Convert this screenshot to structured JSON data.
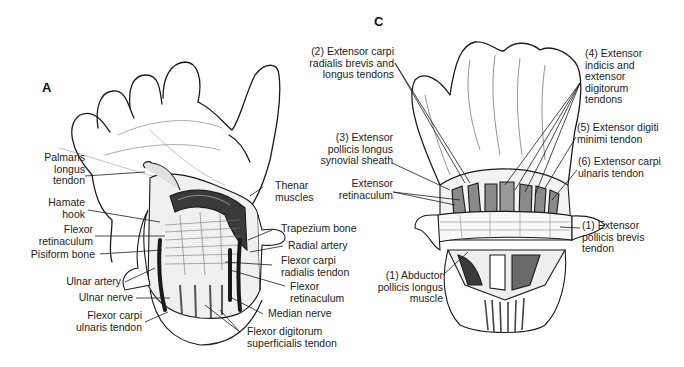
{
  "panels": {
    "a": {
      "letter": "A",
      "labels": {
        "palmaris_longus": "Palmaris\nlongus\ntendon",
        "hamate_hook": "Hamate\nhook",
        "flexor_retinaculum_left": "Flexor\nretinaculum",
        "pisiform_bone": "Pisiform bone",
        "ulnar_artery": "Ulnar artery",
        "ulnar_nerve": "Ulnar nerve",
        "flexor_carpi_ulnaris": "Flexor carpi\nulnaris tendon",
        "thenar_muscles": "Thenar\nmuscles",
        "trapezium_bone": "Trapezium bone",
        "radial_artery": "Radial artery",
        "flexor_carpi_radialis": "Flexor carpi\nradialis tendon",
        "flexor_retinaculum_right": "Flexor\nretinaculum",
        "median_nerve": "Median nerve",
        "flexor_digitorum_superficialis": "Flexor digitorum\nsuperficialis tendon"
      }
    },
    "c": {
      "letter": "C",
      "labels": {
        "ecrb_ecrl": "(2) Extensor carpi\nradialis brevis and\nlongus tendons",
        "epl_sheath": "(3) Extensor\npollicis longus\nsynovial sheath",
        "extensor_retinaculum": "Extensor\nretinaculum",
        "abductor_pollicis_longus": "(1) Abductor\npollicis longus\nmuscle",
        "extensor_indicis": "(4) Extensor\nindicis and\nextensor\ndigitorum\ntendons",
        "extensor_digiti_minimi": "(5) Extensor digiti\nminimi tendon",
        "extensor_carpi_ulnaris": "(6) Extensor carpi\nulnaris tendon",
        "extensor_pollicis_brevis": "(1) Extensor\npollicis brevis\ntendon"
      }
    }
  },
  "colors": {
    "line": "#1a1a1a",
    "muscle_dark": "#3a3a3a",
    "muscle_mid": "#7a7a7a",
    "tendon_gray": "#9a9a9a"
  }
}
